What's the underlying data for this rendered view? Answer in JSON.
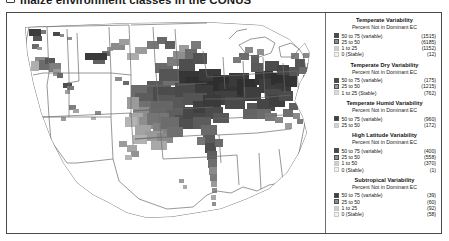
{
  "caption": {
    "bullet_icon": "square-bullet-icon",
    "text": "maize environment classes in the CONUS"
  },
  "figure": {
    "map": {
      "name": "conus-county-choropleth",
      "projection": "albers-equal-area",
      "region": "Continental United States",
      "background_color": "#ffffff",
      "state_outline_color": "#6b6b6b",
      "description": "County-level grayscale choropleth of maize environment class variability across the continental United States"
    },
    "legend_panel": {
      "subtitle_common": "Percent Not in Dominant EC",
      "blocks": [
        {
          "title": "Temperate Variability",
          "subtitle": "Percent Not in Dominant EC",
          "rows": [
            {
              "label": "50 to 75 (variable)",
              "count": "(1515)",
              "color": "#4a4a4a"
            },
            {
              "label": "25 to 50",
              "count": "(6185)",
              "color": "#8e8e8e"
            },
            {
              "label": "1 to 25",
              "count": "(1152)",
              "color": "#cfcfcf"
            },
            {
              "label": "0 (Stable)",
              "count": "(12)",
              "color": "#f2f2f2"
            }
          ]
        },
        {
          "title": "Temperate Dry Variability",
          "subtitle": "Percent Not in Dominant EC",
          "rows": [
            {
              "label": "50 to 75 (variable)",
              "count": "(175)",
              "color": "#4a4a4a"
            },
            {
              "label": "25 to 50",
              "count": "(1215)",
              "color": "#9a9a9a"
            },
            {
              "label": "1 to 25 (Stable)",
              "count": "(762)",
              "color": "#dcdcdc"
            }
          ]
        },
        {
          "title": "Temperate Humid Variability",
          "subtitle": "Percent Not in Dominant EC",
          "rows": [
            {
              "label": "50 to 75 (variable)",
              "count": "(960)",
              "color": "#3f3f3f"
            },
            {
              "label": "25 to 50",
              "count": "(172)",
              "color": "#d2d2d2"
            }
          ]
        },
        {
          "title": "High Latitude Variability",
          "subtitle": "Percent Not in Dominant EC",
          "rows": [
            {
              "label": "50 to 75 (variable)",
              "count": "(400)",
              "color": "#4a4a4a"
            },
            {
              "label": "25 to 50",
              "count": "(558)",
              "color": "#8e8e8e"
            },
            {
              "label": "1 to 50",
              "count": "(370)",
              "color": "#cfcfcf"
            },
            {
              "label": "0 (Stable)",
              "count": "(1)",
              "color": "#f2f2f2"
            }
          ]
        },
        {
          "title": "Subtropical Variability",
          "subtitle": "Percent Not in Dominant EC",
          "rows": [
            {
              "label": "50 to 75 (variable)",
              "count": "(39)",
              "color": "#3f3f3f"
            },
            {
              "label": "25 to 50",
              "count": "(60)",
              "color": "#8e8e8e"
            },
            {
              "label": "1 to 25",
              "count": "(92)",
              "color": "#cfcfcf"
            },
            {
              "label": "0 (Stable)",
              "count": "(58)",
              "color": "#f2f2f2"
            }
          ]
        }
      ]
    }
  }
}
